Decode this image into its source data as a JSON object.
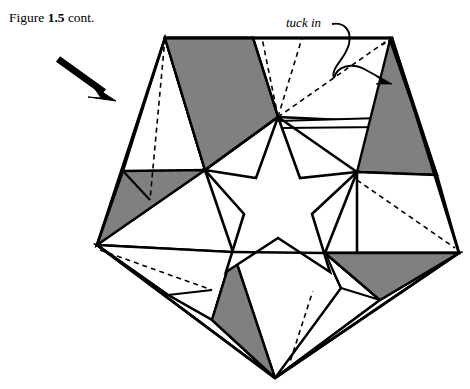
{
  "figure": {
    "caption_prefix": "Figure ",
    "caption_number": "1.5",
    "caption_suffix": " cont.",
    "caption_full": "Figure 1.5 cont."
  },
  "annotations": {
    "tuck_in_label": "tuck in",
    "tuck_in_arrow": "curved-arrow-icon",
    "direction_arrow": "thick-arrow-icon"
  },
  "style": {
    "paper_white": "#ffffff",
    "shaded_gray": "#808080",
    "ink_black": "#000000",
    "line_solid": "solid-edge",
    "line_dashed": "dashed-fold-line"
  },
  "geometry": {
    "outer_pentagon": [
      [
        165,
        38
      ],
      [
        392,
        38
      ],
      [
        459,
        253
      ],
      [
        275,
        378
      ],
      [
        97,
        245
      ]
    ],
    "star_hole": [
      [
        278,
        117
      ],
      [
        357,
        172
      ],
      [
        325,
        253
      ],
      [
        233,
        252
      ],
      [
        205,
        170
      ]
    ],
    "panel_count": 5,
    "shaded_triangle_count": 6
  },
  "labels": {
    "panel_names": [
      "panel-top",
      "panel-upper-right",
      "panel-lower-right",
      "panel-bottom",
      "panel-left"
    ]
  }
}
